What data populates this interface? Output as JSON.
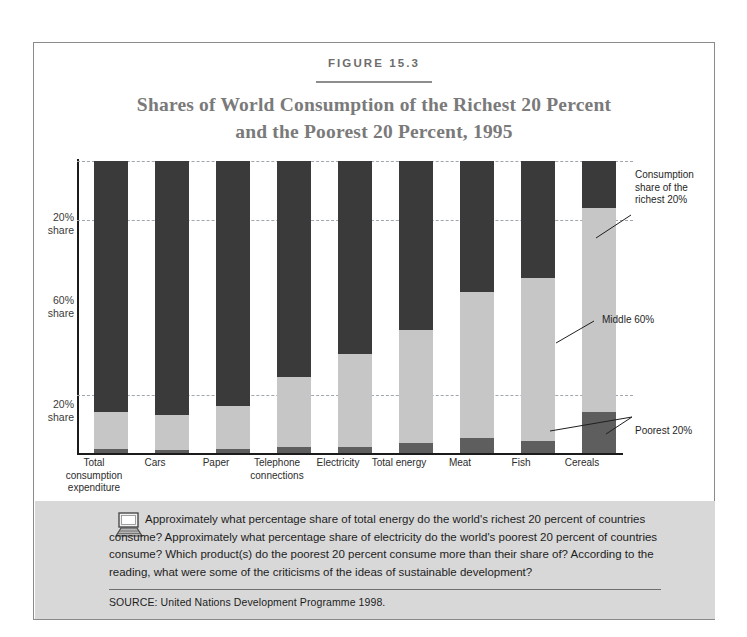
{
  "figure": {
    "number": "FIGURE 15.3",
    "title_line1": "Shares of World Consumption of the Richest 20 Percent",
    "title_line2": "and the Poorest 20 Percent, 1995"
  },
  "axis": {
    "y_labels": [
      {
        "line1": "20%",
        "line2": "share"
      },
      {
        "line1": "60%",
        "line2": "share"
      },
      {
        "line1": "20%",
        "line2": "share"
      }
    ]
  },
  "callouts": {
    "rich": "Consumption share of the richest 20%",
    "middle": "Middle 60%",
    "poor": "Poorest 20%"
  },
  "footer": {
    "icon": "computer-icon",
    "question": "Approximately what percentage share of total energy do the world's richest 20 percent of countries consume? Approximately what percentage share of electricity do the world's poorest 20 percent of countries consume? Which product(s) do the poorest 20 percent consume more than their share of? According to the reading, what were some of the criticisms of the ideas of sustainable development?",
    "source": "SOURCE: United Nations Development Programme 1998."
  },
  "chart_data": {
    "type": "bar",
    "subtype": "stacked-100-percent",
    "title": "Shares of World Consumption of the Richest 20 Percent and the Poorest 20 Percent, 1995",
    "xlabel": "",
    "ylabel": "",
    "ylim": [
      0,
      100
    ],
    "grid": true,
    "gridlines": [
      20,
      80
    ],
    "legend_position": "right-callouts",
    "categories": [
      "Total consumption expenditure",
      "Cars",
      "Paper",
      "Telephone connections",
      "Electricity",
      "Total energy",
      "Meat",
      "Fish",
      "Cereals"
    ],
    "category_labels": [
      [
        "Total",
        "consumption",
        "expenditure"
      ],
      [
        "Cars"
      ],
      [
        "Paper"
      ],
      [
        "Telephone",
        "connections"
      ],
      [
        "Electricity"
      ],
      [
        "Total energy"
      ],
      [
        "Meat"
      ],
      [
        "Fish"
      ],
      [
        "Cereals"
      ]
    ],
    "series": [
      {
        "name": "Consumption share of the richest 20%",
        "color": "#3a3a3a",
        "values": [
          86,
          87,
          84,
          74,
          66,
          58,
          45,
          40,
          16
        ]
      },
      {
        "name": "Middle 60%",
        "color": "#c6c6c6",
        "values": [
          12.7,
          12,
          14.7,
          24,
          32,
          38.5,
          50,
          56,
          70
        ]
      },
      {
        "name": "Poorest 20%",
        "color": "#5e5e5e",
        "values": [
          1.3,
          1,
          1.3,
          2,
          2,
          3.5,
          5,
          4,
          14
        ]
      }
    ]
  }
}
